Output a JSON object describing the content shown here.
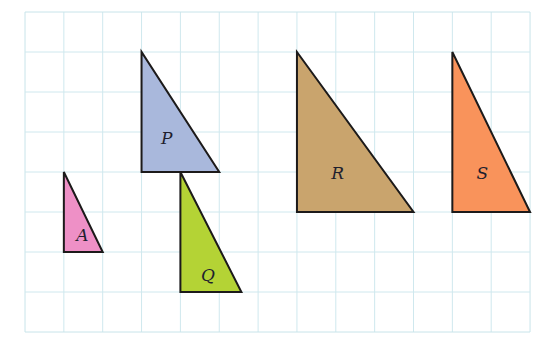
{
  "diagram": {
    "type": "triangles-on-grid",
    "grid": {
      "origin_px": [
        25,
        12
      ],
      "cell_w_px": 38.85,
      "cell_h_px": 40,
      "cols": 13,
      "rows": 8,
      "line_color": "#cfe8ee",
      "border_color": "#c8e4ea"
    },
    "shapes": [
      {
        "id": "A",
        "label": "A",
        "fill": "#ee90c6",
        "vertices_grid": [
          [
            1,
            4
          ],
          [
            1,
            6
          ],
          [
            2,
            6
          ]
        ],
        "label_pos_grid": [
          1.32,
          5.72
        ]
      },
      {
        "id": "P",
        "label": "P",
        "fill": "#a9b8dc",
        "vertices_grid": [
          [
            3,
            1
          ],
          [
            3,
            4
          ],
          [
            5,
            4
          ]
        ],
        "label_pos_grid": [
          3.5,
          3.3
        ]
      },
      {
        "id": "Q",
        "label": "Q",
        "fill": "#b4d335",
        "vertices_grid": [
          [
            4,
            4
          ],
          [
            4,
            7
          ],
          [
            5.57,
            7
          ]
        ],
        "label_pos_grid": [
          4.53,
          6.72
        ]
      },
      {
        "id": "R",
        "label": "R",
        "fill": "#c9a46d",
        "vertices_grid": [
          [
            7,
            1
          ],
          [
            7,
            5
          ],
          [
            10,
            5
          ]
        ],
        "label_pos_grid": [
          7.88,
          4.18
        ]
      },
      {
        "id": "S",
        "label": "S",
        "fill": "#f9935b",
        "vertices_grid": [
          [
            11,
            1
          ],
          [
            11,
            5
          ],
          [
            13,
            5
          ]
        ],
        "label_pos_grid": [
          11.62,
          4.18
        ]
      }
    ],
    "stroke_color": "#1c1a1a"
  }
}
